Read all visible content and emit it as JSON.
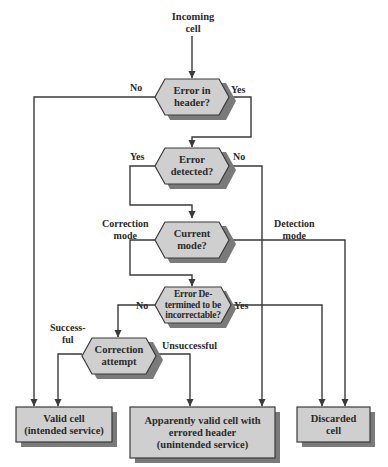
{
  "diagram": {
    "type": "flowchart",
    "start": {
      "label_lines": [
        "Incoming",
        "cell"
      ]
    },
    "colors": {
      "node_fill": "#cfcfcf",
      "node_stroke": "#3a3a3a",
      "shadow": "#7a7a7a",
      "line": "#3a3a3a",
      "text": "#2a2a2a"
    },
    "decisions": [
      {
        "id": "error_in_header",
        "lines": [
          "Error in",
          "header?"
        ]
      },
      {
        "id": "error_detected",
        "lines": [
          "Error",
          "detected?"
        ]
      },
      {
        "id": "current_mode",
        "lines": [
          "Current",
          "mode?"
        ]
      },
      {
        "id": "incorrectable",
        "lines": [
          "Error De-",
          "termined to be",
          "incorrectable?"
        ]
      },
      {
        "id": "correction_attempt",
        "lines": [
          "Correction",
          "attempt"
        ]
      }
    ],
    "outcomes": [
      {
        "id": "valid_cell",
        "lines": [
          "Valid cell",
          "(intended service)"
        ]
      },
      {
        "id": "apparently_valid",
        "lines": [
          "Apparently valid cell with",
          "errored header",
          "(unintended service)"
        ]
      },
      {
        "id": "discarded",
        "lines": [
          "Discarded",
          "cell"
        ]
      }
    ],
    "edge_labels": {
      "header_no": "No",
      "header_yes": "Yes",
      "detected_yes": "Yes",
      "detected_no": "No",
      "correction_mode": [
        "Correction",
        "mode"
      ],
      "detection_mode": [
        "Detection",
        "mode"
      ],
      "incorrectable_no": "No",
      "incorrectable_yes": "Yes",
      "successful": [
        "Success-",
        "ful"
      ],
      "unsuccessful": "Unsuccessful"
    },
    "edges": [
      {
        "from": "start",
        "to": "error_in_header"
      },
      {
        "from": "error_in_header",
        "to": "valid_cell",
        "label": "No"
      },
      {
        "from": "error_in_header",
        "to": "error_detected",
        "label": "Yes"
      },
      {
        "from": "error_detected",
        "to": "current_mode",
        "label": "Yes"
      },
      {
        "from": "error_detected",
        "to": "apparently_valid",
        "label": "No"
      },
      {
        "from": "current_mode",
        "to": "incorrectable",
        "label": "Correction mode"
      },
      {
        "from": "current_mode",
        "to": "discarded",
        "label": "Detection mode"
      },
      {
        "from": "incorrectable",
        "to": "correction_attempt",
        "label": "No"
      },
      {
        "from": "incorrectable",
        "to": "discarded",
        "label": "Yes"
      },
      {
        "from": "correction_attempt",
        "to": "valid_cell",
        "label": "Successful"
      },
      {
        "from": "correction_attempt",
        "to": "apparently_valid",
        "label": "Unsuccessful"
      }
    ]
  }
}
